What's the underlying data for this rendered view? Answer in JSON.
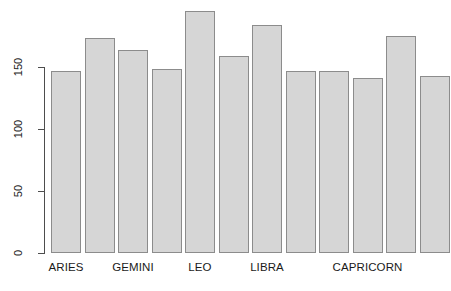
{
  "chart_data": {
    "type": "bar",
    "title": "",
    "subtitle": "",
    "xlabel": "",
    "ylabel": "",
    "ylim": [
      0,
      200
    ],
    "grid": false,
    "legend": null,
    "categories": [
      "ARIES",
      "TAURUS",
      "GEMINI",
      "CANCER",
      "LEO",
      "VIRGO",
      "LIBRA",
      "SCORPIO",
      "SAGITTARIUS",
      "CAPRICORN",
      "AQUARIUS",
      "PISCES"
    ],
    "values": [
      147,
      173,
      164,
      148,
      195,
      159,
      184,
      147,
      147,
      141,
      175,
      143
    ],
    "visible_category_labels": [
      "ARIES",
      "GEMINI",
      "LEO",
      "LIBRA",
      "CAPRICORN"
    ],
    "labeled_bar_indices": [
      0,
      2,
      4,
      6,
      9
    ],
    "y_ticks": [
      0,
      50,
      100,
      150
    ],
    "y_tick_labels": [
      "0",
      "50",
      "100",
      "150"
    ],
    "bar_fill_color": "#d6d6d6",
    "bar_border_color": "#8c8c8c",
    "axis_color": "#4d4d4d",
    "text_color": "#1a1a1a",
    "background_color": "#ffffff"
  },
  "layout": {
    "plot_left": 51,
    "plot_baseline_y": 253,
    "bar_width": 30,
    "bar_pitch": 33.5,
    "units_per_pixel": 0.8065,
    "pixels_per_unit": 1.24
  }
}
